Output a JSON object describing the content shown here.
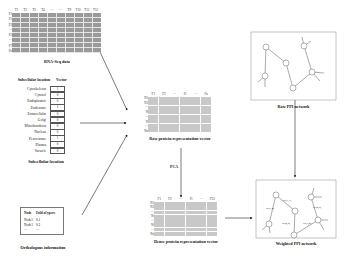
{
  "rnaseq": {
    "columns": [
      "T1",
      "T2",
      "T3",
      "T4",
      "···",
      "···",
      "T9",
      "T10",
      "T11",
      "T12"
    ],
    "rows": [
      "P1",
      "P2",
      "P3",
      "···",
      "P5",
      "···",
      "P7",
      "Pn"
    ],
    "caption": "RNA-Seq data"
  },
  "subcellular": {
    "header_location": "Subcellular location",
    "header_vector": "Vector",
    "items": [
      {
        "name": "Cytoskeleton",
        "value": "1"
      },
      {
        "name": "Cytosol",
        "value": "0"
      },
      {
        "name": "Endoplasmic",
        "value": "0"
      },
      {
        "name": "Endosome",
        "value": "1"
      },
      {
        "name": "Extracellular",
        "value": "0"
      },
      {
        "name": "Golgi",
        "value": "0"
      },
      {
        "name": "Mitochondrion",
        "value": "0"
      },
      {
        "name": "Nucleus",
        "value": "0"
      },
      {
        "name": "Peroxisome",
        "value": "1"
      },
      {
        "name": "Plasma",
        "value": "0"
      },
      {
        "name": "Vacuole",
        "value": "0"
      }
    ],
    "caption": "Subcellular location"
  },
  "orthologous": {
    "header_node": "Node",
    "header_score": "Fold of ypers",
    "rows": [
      {
        "node": "Node1",
        "score": "0.1"
      },
      {
        "node": "Node1",
        "score": "0.2"
      },
      {
        "node": "···",
        "score": "···"
      }
    ],
    "caption": "Orthologous information"
  },
  "raw_vector": {
    "columns": [
      "F1",
      "F2",
      "···",
      "Fi",
      "···",
      "Fn"
    ],
    "rows": [
      "N1",
      "N2",
      "···",
      "N",
      "···",
      "N",
      "···",
      "Nn"
    ],
    "caption": "Raw protein representation vector"
  },
  "pca_label": "PCA",
  "dense_vector": {
    "columns": [
      "F1",
      "F2",
      "···",
      "Fi",
      "···",
      "F32"
    ],
    "rows": [
      "N1",
      "N2",
      "···",
      "Ni",
      "···",
      "Ni",
      "···",
      "Nn"
    ],
    "caption": "Dense protein representation vector"
  },
  "raw_ppi": {
    "caption": "Raw PPI network"
  },
  "weighted_ppi": {
    "edge_labels": [
      "W(1,3)",
      "W(1,2)",
      "W(2,5)",
      "W(3,4)",
      "W(4,6)"
    ],
    "caption": "Weighted PPI network"
  }
}
